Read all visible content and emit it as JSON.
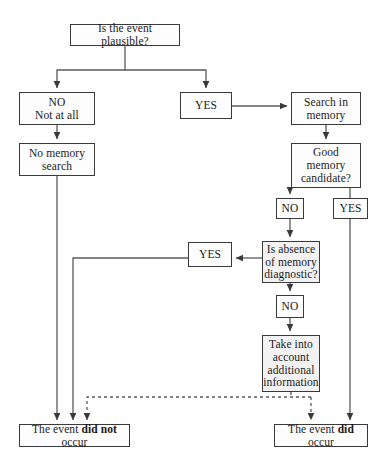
{
  "diagram": {
    "type": "flowchart",
    "colors": {
      "stroke": "#3a3a3a",
      "node_fill": "#fdfdfd",
      "shaded_fill": "#f2f2f2",
      "background": "#ffffff",
      "text": "#1a1a1a"
    },
    "nodes": {
      "question": "Is the event plausible?",
      "no_at_all": "NO\nNot at all",
      "yes_top": "YES",
      "search_memory": "Search in\nmemory",
      "no_memory_search": "No memory\nsearch",
      "good_memory_candidate": "Good\nmemory\ncandidate?",
      "no_mid": "NO",
      "yes_right": "YES",
      "yes_left": "YES",
      "absence_diagnostic": "Is absence\nof memory\ndiagnostic?",
      "no_low": "NO",
      "take_into_account": "Take into\naccount\nadditional\ninformation",
      "did_not_occur_prefix": "The event ",
      "did_not_occur_bold": "did not",
      "did_not_occur_suffix": " occur",
      "did_occur_prefix": "The event ",
      "did_occur_bold": "did",
      "did_occur_suffix": " occur"
    },
    "edges": [
      {
        "name": "question-to-no",
        "from": "question",
        "to": "no_at_all",
        "style": "solid",
        "arrow": true
      },
      {
        "name": "question-to-yes",
        "from": "question",
        "to": "yes_top",
        "style": "solid",
        "arrow": true
      },
      {
        "name": "yes-to-search",
        "from": "yes_top",
        "to": "search_memory",
        "style": "solid",
        "arrow": true
      },
      {
        "name": "no-to-nomemorysearch",
        "from": "no_at_all",
        "to": "no_memory_search",
        "style": "solid",
        "arrow": true
      },
      {
        "name": "search-to-goodmemory",
        "from": "search_memory",
        "to": "good_memory_candidate",
        "style": "solid",
        "arrow": true
      },
      {
        "name": "goodmemory-to-no",
        "from": "good_memory_candidate",
        "to": "no_mid",
        "style": "solid",
        "arrow": true
      },
      {
        "name": "goodmemory-to-yes",
        "from": "good_memory_candidate",
        "to": "yes_right",
        "style": "solid",
        "arrow": false
      },
      {
        "name": "no-to-absence",
        "from": "no_mid",
        "to": "absence_diagnostic",
        "style": "solid",
        "arrow": true
      },
      {
        "name": "absence-to-yes",
        "from": "absence_diagnostic",
        "to": "yes_left",
        "style": "solid",
        "arrow": true
      },
      {
        "name": "absence-to-no",
        "from": "absence_diagnostic",
        "to": "no_low",
        "style": "solid",
        "arrow": true
      },
      {
        "name": "no-to-takeinto",
        "from": "no_low",
        "to": "take_into_account",
        "style": "solid",
        "arrow": true
      },
      {
        "name": "nomemorysearch-to-didnot",
        "from": "no_memory_search",
        "to": "did_not_occur",
        "style": "solid",
        "arrow": true
      },
      {
        "name": "yesleft-to-didnot",
        "from": "yes_left",
        "to": "did_not_occur",
        "style": "solid",
        "arrow": true
      },
      {
        "name": "takeinto-to-didnot",
        "from": "take_into_account",
        "to": "did_not_occur",
        "style": "dashed",
        "arrow": true
      },
      {
        "name": "takeinto-to-did",
        "from": "take_into_account",
        "to": "did_occur",
        "style": "dashed",
        "arrow": true
      },
      {
        "name": "yesright-to-did",
        "from": "yes_right",
        "to": "did_occur",
        "style": "solid",
        "arrow": true
      }
    ]
  }
}
